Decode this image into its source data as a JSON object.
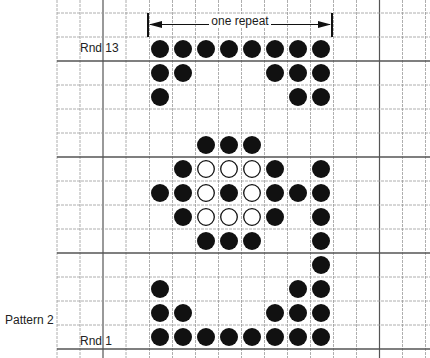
{
  "labels": {
    "pattern": "Pattern 2",
    "round_top": "Rnd 13",
    "round_bottom": "Rnd 1",
    "repeat": "one repeat"
  },
  "legend_symbols": {
    "filled": "filled-circle",
    "open": "open-circle",
    "empty": "blank"
  },
  "colors": {
    "ink": "#111111",
    "grid": "#9a9a9a",
    "grid_heavy": "#555555"
  },
  "chart_data": {
    "type": "table",
    "title": "Pattern 2",
    "columns_in_repeat": 8,
    "rounds": 13,
    "rows": [
      {
        "round": 13,
        "cells": "FFFFFFFF"
      },
      {
        "round": 12,
        "cells": "FF...FFF"
      },
      {
        "round": 11,
        "cells": "F.....FF"
      },
      {
        "round": 10,
        "cells": "........"
      },
      {
        "round": 9,
        "cells": "..FFF..."
      },
      {
        "round": 8,
        "cells": ".FOOOF.F"
      },
      {
        "round": 7,
        "cells": "FFOFOFFF"
      },
      {
        "round": 6,
        "cells": ".FOOOF.F"
      },
      {
        "round": 5,
        "cells": "..FFF..F"
      },
      {
        "round": 4,
        "cells": ".......F"
      },
      {
        "round": 3,
        "cells": "F.....FF"
      },
      {
        "round": 2,
        "cells": "FF...FFF"
      },
      {
        "round": 1,
        "cells": "FFFFFFFF"
      }
    ]
  }
}
